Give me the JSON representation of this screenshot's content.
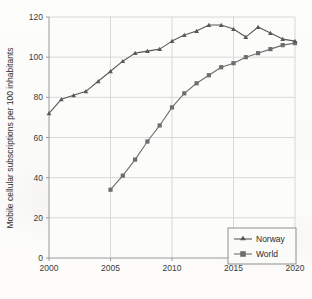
{
  "chart_data": {
    "type": "line",
    "title": "",
    "xlabel": "",
    "ylabel": "Mobile cellular subscriptions per 100 inhabitants",
    "xlim": [
      2000,
      2020
    ],
    "ylim": [
      0,
      120
    ],
    "xticks": [
      2000,
      2005,
      2010,
      2015,
      2020
    ],
    "yticks": [
      0,
      20,
      40,
      60,
      80,
      100,
      120
    ],
    "grid": true,
    "legend_position": "bottom-right",
    "series": [
      {
        "name": "Norway",
        "marker": "triangle",
        "color": "#595959",
        "x": [
          2000,
          2001,
          2002,
          2003,
          2004,
          2005,
          2006,
          2007,
          2008,
          2009,
          2010,
          2011,
          2012,
          2013,
          2014,
          2015,
          2016,
          2017,
          2018,
          2019,
          2020
        ],
        "values": [
          72,
          79,
          81,
          83,
          88,
          93,
          98,
          102,
          103,
          104,
          108,
          111,
          113,
          116,
          116,
          114,
          110,
          115,
          112,
          109,
          108
        ]
      },
      {
        "name": "World",
        "marker": "square",
        "color": "#6e6e6e",
        "x": [
          2005,
          2006,
          2007,
          2008,
          2009,
          2010,
          2011,
          2012,
          2013,
          2014,
          2015,
          2016,
          2017,
          2018,
          2019,
          2020
        ],
        "values": [
          34,
          41,
          49,
          58,
          66,
          75,
          82,
          87,
          91,
          95,
          97,
          100,
          102,
          104,
          106,
          107
        ]
      }
    ]
  },
  "axes": {
    "y_title": "Mobile cellular subscriptions per 100 inhabitants",
    "y_tick_labels": [
      "0",
      "20",
      "40",
      "60",
      "80",
      "100",
      "120"
    ],
    "x_tick_labels": [
      "2000",
      "2005",
      "2010",
      "2015",
      "2020"
    ]
  },
  "legend": {
    "entries": [
      {
        "label": "Norway",
        "marker": "triangle-marker"
      },
      {
        "label": "World",
        "marker": "square-marker"
      }
    ]
  },
  "colors": {
    "norway_line": "#595959",
    "world_line": "#6e6e6e",
    "grid": "#d8d8d8",
    "axis": "#9a9a9a",
    "text": "#2f2f2f"
  }
}
